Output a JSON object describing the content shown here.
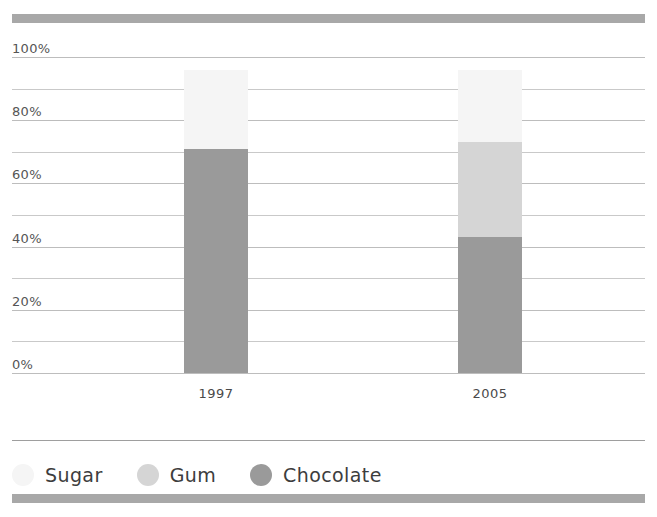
{
  "chart_data": {
    "type": "bar",
    "subtype": "stacked-percentage-column",
    "title": "",
    "subtitle": "",
    "xlabel": "",
    "ylabel": "",
    "categories": [
      "1997",
      "2005"
    ],
    "series": [
      {
        "name": "Chocolate",
        "values": [
          71,
          43
        ],
        "color": "#9a9a9a"
      },
      {
        "name": "Gum",
        "values": [
          0,
          30
        ],
        "color": "#d5d5d5"
      },
      {
        "name": "Sugar",
        "values": [
          25,
          23
        ],
        "color": "#f5f5f5"
      }
    ],
    "stack_order_bottom_to_top": [
      "Chocolate",
      "Gum",
      "Sugar"
    ],
    "ylim": [
      0,
      100
    ],
    "ytick_labels": [
      "0%",
      "20%",
      "40%",
      "60%",
      "80%",
      "100%"
    ],
    "ytick_values": [
      0,
      20,
      40,
      60,
      80,
      100
    ],
    "gridline_interval": 10,
    "grid": true,
    "legend_position": "bottom-left",
    "annotations": []
  },
  "axes": {
    "y": {
      "ticks": [
        {
          "label": "100%",
          "value": 100
        },
        {
          "label": "80%",
          "value": 80
        },
        {
          "label": "60%",
          "value": 60
        },
        {
          "label": "40%",
          "value": 40
        },
        {
          "label": "20%",
          "value": 20
        },
        {
          "label": "0%",
          "value": 0
        }
      ]
    },
    "x": {
      "ticks": [
        {
          "label": "1997"
        },
        {
          "label": "2005"
        }
      ]
    }
  },
  "legend": {
    "items": [
      {
        "label": "Sugar",
        "color": "#f5f5f5"
      },
      {
        "label": "Gum",
        "color": "#d5d5d5"
      },
      {
        "label": "Chocolate",
        "color": "#9a9a9a"
      }
    ]
  },
  "style": {
    "rule_color": "#a8a8a8",
    "gridline_color": "#c9c9c9",
    "separator_color": "#9e9e9e",
    "background": "#ffffff"
  }
}
